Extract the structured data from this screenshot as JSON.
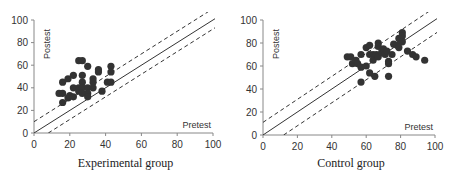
{
  "chart_data": [
    {
      "type": "scatter",
      "title": "Experimental group",
      "xlabel": "Pretest",
      "ylabel": "Postest",
      "xlim": [
        0,
        100
      ],
      "ylim": [
        0,
        100
      ],
      "xticks": [
        0,
        20,
        40,
        60,
        80,
        100
      ],
      "yticks": [
        0,
        20,
        40,
        60,
        80,
        100
      ],
      "grid": false,
      "reference_lines": [
        {
          "name": "identity",
          "style": "solid",
          "intercept": 0,
          "slope": 1
        },
        {
          "name": "upper band",
          "style": "dashed",
          "intercept": 10,
          "slope": 1
        },
        {
          "name": "lower band",
          "style": "dashed",
          "intercept": -8,
          "slope": 1
        }
      ],
      "points": [
        [
          14,
          35
        ],
        [
          16,
          45
        ],
        [
          16,
          35
        ],
        [
          16,
          27
        ],
        [
          19,
          48
        ],
        [
          19,
          31
        ],
        [
          20,
          33
        ],
        [
          22,
          51
        ],
        [
          22,
          40
        ],
        [
          22,
          32
        ],
        [
          25,
          64
        ],
        [
          27,
          64
        ],
        [
          25,
          40
        ],
        [
          25,
          37
        ],
        [
          27,
          51
        ],
        [
          27,
          45
        ],
        [
          27,
          40
        ],
        [
          27,
          35
        ],
        [
          30,
          59
        ],
        [
          30,
          40
        ],
        [
          30,
          35
        ],
        [
          30,
          32
        ],
        [
          33,
          48
        ],
        [
          33,
          45
        ],
        [
          33,
          40
        ],
        [
          36,
          56
        ],
        [
          36,
          54
        ],
        [
          38,
          37
        ],
        [
          41,
          45
        ],
        [
          43,
          59
        ],
        [
          43,
          54
        ],
        [
          43,
          45
        ]
      ]
    },
    {
      "type": "scatter",
      "title": "Control group",
      "xlabel": "Pretest",
      "ylabel": "Postest",
      "xlim": [
        0,
        100
      ],
      "ylim": [
        0,
        100
      ],
      "xticks": [
        0,
        20,
        40,
        60,
        80,
        100
      ],
      "yticks": [
        0,
        20,
        40,
        60,
        80,
        100
      ],
      "grid": false,
      "reference_lines": [
        {
          "name": "identity",
          "style": "solid",
          "intercept": 0,
          "slope": 1
        },
        {
          "name": "upper band",
          "style": "dashed",
          "intercept": 11,
          "slope": 1
        },
        {
          "name": "lower band",
          "style": "dashed",
          "intercept": -12,
          "slope": 1
        }
      ],
      "points": [
        [
          49,
          68
        ],
        [
          51,
          68
        ],
        [
          52,
          62
        ],
        [
          54,
          65
        ],
        [
          55,
          62
        ],
        [
          57,
          70
        ],
        [
          57,
          59
        ],
        [
          57,
          46
        ],
        [
          60,
          76
        ],
        [
          60,
          60
        ],
        [
          62,
          78
        ],
        [
          62,
          70
        ],
        [
          62,
          54
        ],
        [
          64,
          70
        ],
        [
          64,
          65
        ],
        [
          65,
          51
        ],
        [
          66,
          70
        ],
        [
          67,
          80
        ],
        [
          67,
          77
        ],
        [
          67,
          68
        ],
        [
          69,
          72
        ],
        [
          70,
          75
        ],
        [
          71,
          70
        ],
        [
          72,
          73
        ],
        [
          73,
          64
        ],
        [
          73,
          62
        ],
        [
          73,
          51
        ],
        [
          75,
          70
        ],
        [
          76,
          79
        ],
        [
          78,
          78
        ],
        [
          79,
          84
        ],
        [
          79,
          76
        ],
        [
          81,
          89
        ],
        [
          81,
          86
        ],
        [
          81,
          81
        ],
        [
          84,
          73
        ],
        [
          87,
          70
        ],
        [
          89,
          68
        ],
        [
          94,
          65
        ]
      ]
    }
  ],
  "charts": [
    {
      "caption": "Experimental group",
      "x_axis_word": "Pretest",
      "y_axis_word": "Postest",
      "ticks": [
        "0",
        "20",
        "40",
        "60",
        "80",
        "100"
      ]
    },
    {
      "caption": "Control group",
      "x_axis_word": "Pretest",
      "y_axis_word": "Postest",
      "ticks": [
        "0",
        "20",
        "40",
        "60",
        "80",
        "100"
      ]
    }
  ],
  "colors": {
    "point": "#333333",
    "axis": "#888888",
    "line": "#333333"
  }
}
